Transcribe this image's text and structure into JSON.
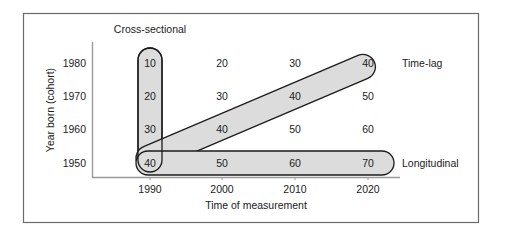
{
  "figure": {
    "frame_color": "#6b6b6b",
    "background": "#ffffff",
    "axis_color": "#9a9a9a",
    "capsule_fill": "#dcdcdc",
    "capsule_stroke": "#1b1b1b",
    "text_color": "#1b1b1b"
  },
  "axes": {
    "x_title": "Time of measurement",
    "y_title": "Year born (cohort)",
    "x_ticks": [
      "1990",
      "2000",
      "2010",
      "2020"
    ],
    "y_ticks": [
      "1980",
      "1970",
      "1960",
      "1950"
    ]
  },
  "annotations": {
    "cross_sectional": "Cross-sectional",
    "time_lag": "Time-lag",
    "longitudinal": "Longitudinal"
  },
  "chart_data": {
    "type": "table",
    "title": "",
    "xlabel": "Time of measurement",
    "ylabel": "Year born (cohort)",
    "columns": [
      "1990",
      "2000",
      "2010",
      "2020"
    ],
    "rows": [
      "1980",
      "1970",
      "1960",
      "1950"
    ],
    "values": [
      [
        10,
        20,
        30,
        40
      ],
      [
        20,
        30,
        40,
        50
      ],
      [
        30,
        40,
        50,
        60
      ],
      [
        40,
        50,
        60,
        70
      ]
    ],
    "highlights": [
      {
        "name": "cross-sectional",
        "orientation": "vertical",
        "column": "1990",
        "cells": [
          10,
          20,
          30,
          40
        ]
      },
      {
        "name": "time-lag",
        "orientation": "diagonal",
        "cells": [
          40,
          40,
          40,
          40
        ]
      },
      {
        "name": "longitudinal",
        "orientation": "horizontal",
        "row": "1950",
        "cells": [
          40,
          50,
          60,
          70
        ]
      }
    ],
    "grid": false,
    "legend": "inline-labels"
  },
  "cells": [
    {
      "v": "10",
      "x": 150,
      "y": 63
    },
    {
      "v": "20",
      "x": 222,
      "y": 63
    },
    {
      "v": "30",
      "x": 295,
      "y": 63
    },
    {
      "v": "40",
      "x": 368,
      "y": 63
    },
    {
      "v": "20",
      "x": 150,
      "y": 96
    },
    {
      "v": "30",
      "x": 222,
      "y": 96
    },
    {
      "v": "40",
      "x": 295,
      "y": 96
    },
    {
      "v": "50",
      "x": 368,
      "y": 96
    },
    {
      "v": "30",
      "x": 150,
      "y": 129
    },
    {
      "v": "40",
      "x": 222,
      "y": 129
    },
    {
      "v": "50",
      "x": 295,
      "y": 129
    },
    {
      "v": "60",
      "x": 368,
      "y": 129
    },
    {
      "v": "40",
      "x": 150,
      "y": 163
    },
    {
      "v": "50",
      "x": 222,
      "y": 163
    },
    {
      "v": "60",
      "x": 295,
      "y": 163
    },
    {
      "v": "70",
      "x": 368,
      "y": 163
    }
  ]
}
